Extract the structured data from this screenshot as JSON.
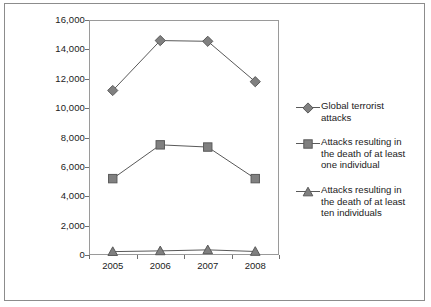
{
  "chart_data": {
    "type": "line",
    "title": "",
    "xlabel": "",
    "ylabel": "",
    "x": [
      "2005",
      "2006",
      "2007",
      "2008"
    ],
    "categories": [
      "2005",
      "2006",
      "2007",
      "2008"
    ],
    "ylim": [
      0,
      16000
    ],
    "ytick_labels": [
      "0",
      "2,000",
      "4,000",
      "6,000",
      "8,000",
      "10,000",
      "12,000",
      "14,000",
      "16,000"
    ],
    "ytick_values": [
      0,
      2000,
      4000,
      6000,
      8000,
      10000,
      12000,
      14000,
      16000
    ],
    "grid": false,
    "legend_position": "right",
    "series": [
      {
        "name": "Global terrorist\nattacks",
        "marker": "diamond",
        "color": "#808080",
        "line_color": "#595959",
        "values": [
          11200,
          14600,
          14550,
          11800
        ]
      },
      {
        "name": "Attacks resulting in\nthe death of at least\none individual",
        "marker": "square",
        "color": "#808080",
        "line_color": "#595959",
        "values": [
          5200,
          7500,
          7350,
          5200
        ]
      },
      {
        "name": "Attacks resulting in\nthe death of at least\nten individuals",
        "marker": "triangle",
        "color": "#808080",
        "line_color": "#595959",
        "values": [
          230,
          280,
          350,
          240
        ]
      }
    ]
  },
  "figure": {
    "border_color": "#8c8c8c",
    "background": "#ffffff",
    "axis_color": "#9a9a9a"
  }
}
